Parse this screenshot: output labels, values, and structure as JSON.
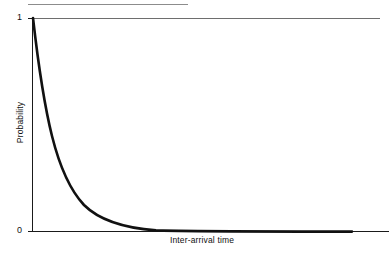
{
  "figure": {
    "title": "",
    "background_color": "#ffffff",
    "top_rule": {
      "name": "top-rule",
      "color": "#8c8c8c"
    }
  },
  "axes": {
    "y_label": "Probability",
    "x_label": "Inter-arrival time",
    "y_ticks": [
      "1",
      "0"
    ],
    "x_ticks": [],
    "axis_color": "#1a1a1a",
    "frame_color": "#6e6e6e"
  },
  "curve": {
    "name": "exponential-decay-curve",
    "color": "#111111",
    "stroke_width": 2.6,
    "path": "M 33,18 C 38,62 44,104 52,136 C 60,168 70,190 84,205 C 100,221 124,228 156,230.4 C 200,231.4 280,231.6 352,231.6"
  },
  "chart_data": {
    "type": "line",
    "title": "",
    "subtitle": "",
    "xlabel": "Inter-arrival time",
    "ylabel": "Probability",
    "xlim": [
      0,
      10
    ],
    "ylim": [
      0,
      1
    ],
    "xticks": [],
    "yticks": [
      0,
      1
    ],
    "ytick_labels": [
      "0",
      "1"
    ],
    "grid": false,
    "legend": null,
    "legend_position": "none",
    "annotations": [],
    "series": [
      {
        "name": "Exponential probability density",
        "formula": "y = exp(-lambda * x)",
        "lambda": 0.87,
        "x": [
          0.0,
          0.25,
          0.5,
          0.75,
          1.0,
          1.25,
          1.5,
          1.75,
          2.0,
          2.5,
          3.0,
          3.5,
          4.0,
          4.5,
          5.0,
          5.5,
          6.0,
          6.5,
          7.0,
          7.5,
          8.0,
          8.5,
          9.0,
          9.5,
          10.0
        ],
        "values": [
          1.0,
          0.8,
          0.65,
          0.52,
          0.42,
          0.34,
          0.27,
          0.22,
          0.18,
          0.11,
          0.07,
          0.05,
          0.03,
          0.02,
          0.013,
          0.008,
          0.005,
          0.004,
          0.002,
          0.0015,
          0.001,
          0.0007,
          0.0004,
          0.0003,
          0.0002
        ]
      }
    ]
  }
}
